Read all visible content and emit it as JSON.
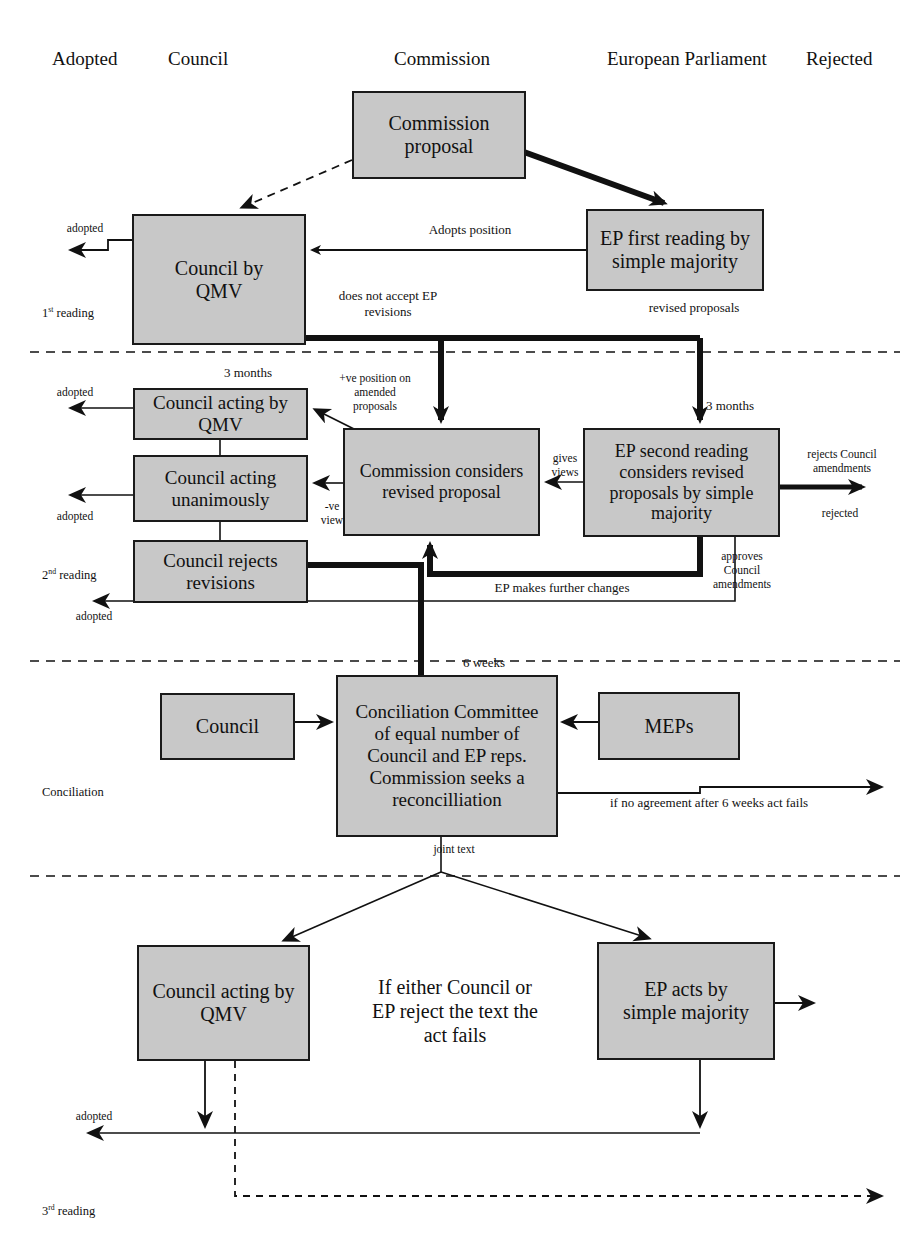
{
  "diagram": {
    "colors": {
      "box_fill": "#c8c8c8",
      "box_stroke": "#1a1a1a",
      "text": "#111111"
    },
    "column_headings": [
      {
        "key": "adopted",
        "label": "Adopted"
      },
      {
        "key": "council",
        "label": "Council"
      },
      {
        "key": "commission",
        "label": "Commission"
      },
      {
        "key": "european_parliament",
        "label": "European Parliament"
      },
      {
        "key": "rejected",
        "label": "Rejected"
      }
    ],
    "stage_labels": [
      {
        "key": "first_reading",
        "label": "1st reading",
        "sup": "st",
        "base": "1",
        "tail": " reading"
      },
      {
        "key": "second_reading",
        "label": "2nd reading",
        "sup": "nd",
        "base": "2",
        "tail": " reading"
      },
      {
        "key": "conciliation",
        "label": "Conciliation"
      },
      {
        "key": "third_reading",
        "label": "3rd reading",
        "sup": "rd",
        "base": "3",
        "tail": " reading"
      }
    ],
    "boxes": [
      {
        "key": "commission_proposal",
        "label": "Commission\nproposal"
      },
      {
        "key": "council_qmv_first",
        "label": "Council by\nQMV"
      },
      {
        "key": "ep_first_reading",
        "label": "EP first reading by\nsimple majority"
      },
      {
        "key": "council_acting_qmv",
        "label": "Council acting by\nQMV"
      },
      {
        "key": "council_acting_unanimously",
        "label": "Council acting\nunanimously"
      },
      {
        "key": "council_rejects_revisions",
        "label": "Council rejects\nrevisions"
      },
      {
        "key": "commission_considers",
        "label": "Commission considers\nrevised proposal"
      },
      {
        "key": "ep_second_reading",
        "label": "EP second reading\nconsiders revised\nproposals by simple\nmajority"
      },
      {
        "key": "council_conciliation",
        "label": "Council"
      },
      {
        "key": "conciliation_committee",
        "label": "Conciliation Committee\nof equal number of\nCouncil and EP reps.\nCommission seeks a\nreconcilliation"
      },
      {
        "key": "meps",
        "label": "MEPs"
      },
      {
        "key": "council_acting_qmv_third",
        "label": "Council acting by\nQMV"
      },
      {
        "key": "ep_acts",
        "label": "EP acts by\nsimple majority"
      }
    ],
    "edge_labels": [
      {
        "key": "adopted_first",
        "label": "adopted"
      },
      {
        "key": "adopts_position",
        "label": "Adopts position"
      },
      {
        "key": "does_not_accept",
        "label": "does not accept EP\nrevisions"
      },
      {
        "key": "revised_proposals",
        "label": "revised proposals"
      },
      {
        "key": "three_months_left",
        "label": "3 months"
      },
      {
        "key": "three_months_right",
        "label": "3 months"
      },
      {
        "key": "positive_position",
        "label": "+ve position on\namended\nproposals"
      },
      {
        "key": "negative_view",
        "label": "-ve\nview"
      },
      {
        "key": "gives_views",
        "label": "gives\nviews"
      },
      {
        "key": "adopted_qmv_second",
        "label": "adopted"
      },
      {
        "key": "adopted_unanimous_second",
        "label": "adopted"
      },
      {
        "key": "rejects_council_amendments",
        "label": "rejects Council\namendments"
      },
      {
        "key": "rejected_second",
        "label": "rejected"
      },
      {
        "key": "approves_council_amendments",
        "label": "approves\nCouncil\namendments"
      },
      {
        "key": "ep_makes_further_changes",
        "label": "EP makes further changes"
      },
      {
        "key": "adopted_rejects_revisions",
        "label": "adopted"
      },
      {
        "key": "six_weeks",
        "label": "6 weeks"
      },
      {
        "key": "no_agreement",
        "label": "if no agreement after 6 weeks act fails"
      },
      {
        "key": "joint_text",
        "label": "joint text"
      },
      {
        "key": "if_either_rejects",
        "label": "If either Council or\nEP reject the text the\nact fails"
      },
      {
        "key": "adopted_third",
        "label": "adopted"
      }
    ]
  }
}
